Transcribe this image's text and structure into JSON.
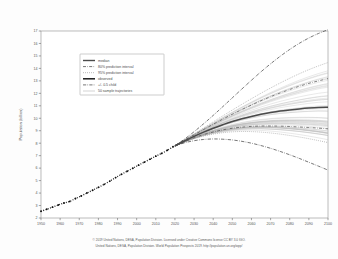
{
  "chart_data": {
    "type": "line",
    "title": "",
    "xlabel": "",
    "ylabel": "Population (billion)",
    "xlim": [
      1950,
      2100
    ],
    "ylim": [
      2,
      17
    ],
    "grid": false,
    "legend_position": "upper-left-inside",
    "xticks": [
      "1950",
      "1960",
      "1970",
      "1980",
      "1990",
      "2000",
      "2010",
      "2020",
      "2030",
      "2040",
      "2050",
      "2060",
      "2070",
      "2080",
      "2090",
      "2100"
    ],
    "yticks": [
      "2",
      "3",
      "4",
      "5",
      "6",
      "7",
      "8",
      "9",
      "10",
      "11",
      "12",
      "13",
      "14",
      "15",
      "16",
      "17"
    ],
    "x": [
      1950,
      1955,
      1960,
      1965,
      1970,
      1975,
      1980,
      1985,
      1990,
      1995,
      2000,
      2005,
      2010,
      2015,
      2020,
      2025,
      2030,
      2035,
      2040,
      2045,
      2050,
      2055,
      2060,
      2065,
      2070,
      2075,
      2080,
      2085,
      2090,
      2095,
      2100
    ],
    "series": [
      {
        "name": "observed",
        "style": "dotted-markers",
        "x": [
          1950,
          1953,
          1956,
          1959,
          1962,
          1965,
          1968,
          1971,
          1974,
          1977,
          1980,
          1983,
          1986,
          1989,
          1992,
          1995,
          1998,
          2001,
          2004,
          2007,
          2010,
          2013,
          2016,
          2019
        ],
        "values": [
          2.54,
          2.7,
          2.87,
          3.04,
          3.2,
          3.33,
          3.56,
          3.77,
          4.0,
          4.23,
          4.46,
          4.7,
          4.96,
          5.24,
          5.5,
          5.75,
          5.99,
          6.24,
          6.48,
          6.72,
          6.96,
          7.18,
          7.43,
          7.71
        ]
      },
      {
        "name": "median",
        "style": "solid",
        "values": [
          null,
          null,
          null,
          null,
          null,
          null,
          null,
          null,
          null,
          null,
          null,
          null,
          null,
          null,
          7.79,
          8.18,
          8.55,
          8.89,
          9.2,
          9.48,
          9.74,
          9.96,
          10.15,
          10.32,
          10.46,
          10.58,
          10.67,
          10.75,
          10.82,
          10.87,
          10.88
        ]
      },
      {
        "name": "80% prediction interval",
        "style": "dash-dot",
        "upper": [
          null,
          null,
          null,
          null,
          null,
          null,
          null,
          null,
          null,
          null,
          null,
          null,
          null,
          null,
          7.8,
          8.24,
          8.67,
          9.1,
          9.52,
          9.93,
          10.32,
          10.7,
          11.06,
          11.41,
          11.73,
          12.03,
          12.31,
          12.57,
          12.8,
          13.0,
          13.18
        ],
        "lower": [
          null,
          null,
          null,
          null,
          null,
          null,
          null,
          null,
          null,
          null,
          null,
          null,
          null,
          null,
          7.78,
          8.12,
          8.43,
          8.69,
          8.9,
          9.07,
          9.2,
          9.29,
          9.35,
          9.38,
          9.38,
          9.37,
          9.34,
          9.3,
          9.26,
          9.21,
          9.15
        ]
      },
      {
        "name": "95% prediction interval",
        "style": "dotted",
        "upper": [
          null,
          null,
          null,
          null,
          null,
          null,
          null,
          null,
          null,
          null,
          null,
          null,
          null,
          null,
          7.81,
          8.28,
          8.75,
          9.23,
          9.71,
          10.19,
          10.66,
          11.12,
          11.57,
          12.01,
          12.43,
          12.83,
          13.21,
          13.57,
          13.9,
          14.2,
          14.47
        ],
        "lower": [
          null,
          null,
          null,
          null,
          null,
          null,
          null,
          null,
          null,
          null,
          null,
          null,
          null,
          null,
          7.77,
          8.09,
          8.36,
          8.57,
          8.73,
          8.84,
          8.91,
          8.94,
          8.93,
          8.89,
          8.82,
          8.73,
          8.62,
          8.5,
          8.36,
          8.21,
          8.05
        ]
      },
      {
        "name": "+/- 0.5 child",
        "style": "dash-dot-wide",
        "upper": [
          null,
          null,
          null,
          null,
          null,
          null,
          null,
          null,
          null,
          null,
          null,
          null,
          null,
          null,
          7.8,
          8.33,
          8.92,
          9.56,
          10.23,
          10.93,
          11.64,
          12.35,
          13.05,
          13.73,
          14.37,
          14.97,
          15.52,
          16.01,
          16.44,
          16.8,
          17.1
        ],
        "lower": [
          null,
          null,
          null,
          null,
          null,
          null,
          null,
          null,
          null,
          null,
          null,
          null,
          null,
          null,
          7.78,
          8.03,
          8.2,
          8.3,
          8.34,
          8.32,
          8.26,
          8.15,
          8.0,
          7.81,
          7.59,
          7.34,
          7.07,
          6.78,
          6.47,
          6.16,
          5.84
        ]
      },
      {
        "name": "50 sample trajectories",
        "style": "thin-grey",
        "count": 50
      }
    ],
    "legend": [
      {
        "label": "median",
        "style": "median"
      },
      {
        "label": "80% prediction interval",
        "style": "pi80"
      },
      {
        "label": "95% prediction interval",
        "style": "pi95"
      },
      {
        "label": "observed",
        "style": "observed"
      },
      {
        "label": "+/- 0.5 child",
        "style": "halfchild"
      },
      {
        "label": "50 sample trajectories",
        "style": "trajectories"
      }
    ],
    "caption": [
      "© 2019 United Nations, DESA, Population Division. Licensed under Creative Commons license CC BY 3.0 IGO.",
      "United Nations, DESA, Population Division. World Population Prospects 2019. http://population.un.org/wpp/"
    ]
  }
}
